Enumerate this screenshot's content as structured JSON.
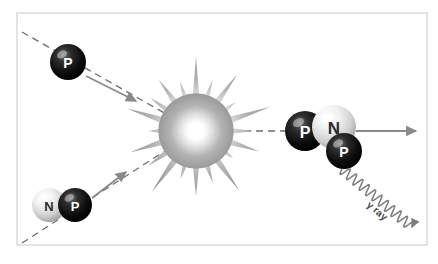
{
  "figure": {
    "background_color": "#ffffff",
    "frame": {
      "name": "diagram-frame",
      "x": 17,
      "y": 13,
      "width": 410,
      "height": 232,
      "stroke": "#d9d9d9"
    },
    "colors": {
      "proton": "#0a0a0a",
      "neutron": "#e8e8e8",
      "arrow": "#8a8a8a",
      "dashed_line": "#6e6e6e",
      "burst_outer": "#9b9b9b",
      "burst_inner": "#ffffff",
      "gamma_wave": "#7d7d7d",
      "label_light": "#ffffff",
      "label_dark": "#2b2b2b"
    }
  },
  "reactants": {
    "proton": {
      "name": "incoming-proton",
      "label": "P",
      "cx": 68,
      "cy": 62,
      "r": 18,
      "type": "proton"
    },
    "deuteron": {
      "name": "incoming-deuteron",
      "nucleons": [
        {
          "label": "N",
          "cx": 49,
          "cy": 205,
          "r": 17,
          "type": "neutron"
        },
        {
          "label": "P",
          "cx": 75,
          "cy": 205,
          "r": 17,
          "type": "proton"
        }
      ]
    }
  },
  "products": {
    "helium3": {
      "name": "product-helium-3",
      "nucleons": [
        {
          "label": "P",
          "cx": 305,
          "cy": 131,
          "r": 20,
          "type": "proton"
        },
        {
          "label": "N",
          "cx": 334,
          "cy": 127,
          "r": 22,
          "type": "neutron"
        },
        {
          "label": "P",
          "cx": 344,
          "cy": 151,
          "r": 18,
          "type": "proton"
        }
      ]
    },
    "gamma": {
      "name": "gamma-ray",
      "label": "γ ray",
      "label_x": 366,
      "label_y": 206,
      "label_rotation": 40,
      "wave_start_x": 342,
      "wave_start_y": 169,
      "wave_end_x": 412,
      "wave_end_y": 227
    }
  },
  "burst": {
    "name": "fusion-burst",
    "cx": 196,
    "cy": 131,
    "outer_radius": 74,
    "inner_radius": 26,
    "spikes": 20
  },
  "arrows": [
    {
      "name": "arrow-proton-inbound",
      "x1": 86,
      "y1": 76,
      "x2": 136,
      "y2": 101,
      "color": "#8a8a8a"
    },
    {
      "name": "arrow-deuteron-inbound",
      "x1": 92,
      "y1": 198,
      "x2": 126,
      "y2": 172,
      "color": "#8a8a8a"
    },
    {
      "name": "arrow-helium3-outbound",
      "x1": 356,
      "y1": 131,
      "x2": 416,
      "y2": 131,
      "color": "#8a8a8a"
    }
  ],
  "dashed_paths": [
    {
      "name": "dashed-path-proton",
      "x1": 22,
      "y1": 32,
      "x2": 196,
      "y2": 131
    },
    {
      "name": "dashed-path-deuteron",
      "x1": 22,
      "y1": 243,
      "x2": 196,
      "y2": 131
    },
    {
      "name": "dashed-path-product",
      "x1": 196,
      "y1": 131,
      "x2": 300,
      "y2": 131
    }
  ]
}
